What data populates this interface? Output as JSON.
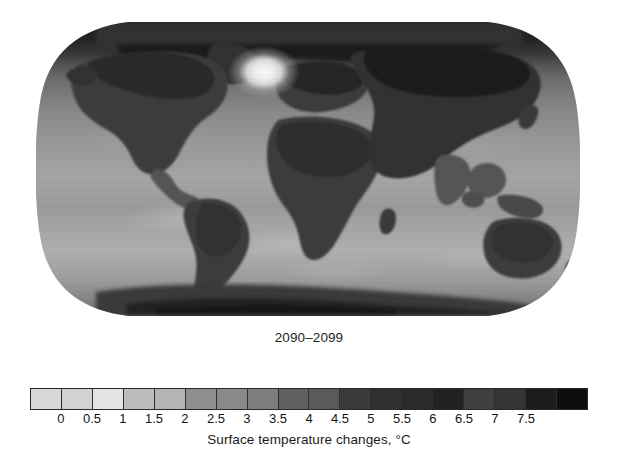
{
  "figure": {
    "period_label": "2090–2099",
    "axis_title": "Surface temperature changes, °C",
    "background": "#ffffff"
  },
  "map": {
    "name": "global-surface-temperature-change-map",
    "projection": "Robinson",
    "alt": "World map shaded by projected surface temperature change, darkest over the Arctic and northern continents, lightest over the Southern Ocean and a bright spot in the North Atlantic"
  },
  "colorbar": {
    "orientation": "horizontal",
    "tick_labels": [
      "0",
      "0.5",
      "1",
      "1.5",
      "2",
      "2.5",
      "3",
      "3.5",
      "4",
      "4.5",
      "5",
      "5.5",
      "6",
      "6.5",
      "7",
      "7.5"
    ],
    "tick_positions_pct": [
      5.55,
      11.11,
      16.66,
      22.22,
      27.77,
      33.33,
      38.88,
      44.44,
      50.0,
      55.55,
      61.11,
      66.66,
      72.22,
      77.77,
      83.33,
      88.88
    ],
    "swatch_count": 18,
    "swatch_colors": [
      "#d8d8d8",
      "#d2d2d2",
      "#e4e4e4",
      "#bdbdbd",
      "#b4b4b4",
      "#8e8e8e",
      "#8a8a8a",
      "#7d7d7d",
      "#606060",
      "#5a5a5a",
      "#3a3a3a",
      "#303030",
      "#2a2a2a",
      "#212121",
      "#3f3f3f",
      "#343434",
      "#1c1c1c",
      "#0d0d0d"
    ]
  },
  "chart_data": {
    "type": "heatmap",
    "title": "2090–2099",
    "xlabel": "",
    "ylabel": "",
    "colorbar_label": "Surface temperature changes, °C",
    "colorbar_ticks": [
      0,
      0.5,
      1,
      1.5,
      2,
      2.5,
      3,
      3.5,
      4,
      4.5,
      5,
      5.5,
      6,
      6.5,
      7,
      7.5
    ],
    "value_range": [
      0,
      8
    ],
    "units": "°C",
    "grid": false,
    "legend_position": "bottom",
    "regions": [
      {
        "name": "Arctic Ocean / high Arctic",
        "value": 7.5
      },
      {
        "name": "Northern Canada & Greenland margin",
        "value": 6.5
      },
      {
        "name": "Northern Siberia",
        "value": 6.5
      },
      {
        "name": "Central Siberia / Central Asia",
        "value": 5.0
      },
      {
        "name": "Northern Europe",
        "value": 4.5
      },
      {
        "name": "Central & Eastern North America",
        "value": 4.5
      },
      {
        "name": "Western North America",
        "value": 4.0
      },
      {
        "name": "Mediterranean / North Africa",
        "value": 4.5
      },
      {
        "name": "Sahara & Sahel",
        "value": 4.5
      },
      {
        "name": "Central & Southern Africa",
        "value": 3.5
      },
      {
        "name": "Amazonia / South America interior",
        "value": 4.0
      },
      {
        "name": "Southern South America",
        "value": 3.0
      },
      {
        "name": "South & Southeast Asia",
        "value": 3.5
      },
      {
        "name": "Australia",
        "value": 3.5
      },
      {
        "name": "North Atlantic warming hole",
        "value": 0.5
      },
      {
        "name": "Tropical oceans",
        "value": 2.5
      },
      {
        "name": "Southern Ocean",
        "value": 1.5
      },
      {
        "name": "Antarctic coast",
        "value": 2.0
      },
      {
        "name": "Antarctic interior",
        "value": 3.5
      }
    ]
  }
}
